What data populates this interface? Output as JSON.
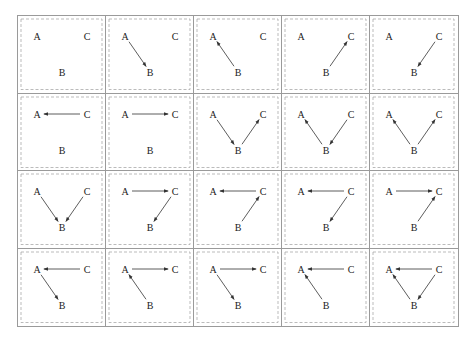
{
  "diagram": {
    "rows": 4,
    "cols": 5,
    "node_labels": {
      "A": "A",
      "B": "B",
      "C": "C"
    },
    "colors": {
      "cell_border": "#9a9a9a",
      "dashed_box": "#aaaaaa",
      "arrow": "#333333",
      "label": "#222222"
    },
    "cells": [
      {
        "edges": []
      },
      {
        "edges": [
          [
            "A",
            "B"
          ]
        ]
      },
      {
        "edges": [
          [
            "B",
            "A"
          ]
        ]
      },
      {
        "edges": [
          [
            "B",
            "C"
          ]
        ]
      },
      {
        "edges": [
          [
            "C",
            "B"
          ]
        ]
      },
      {
        "edges": [
          [
            "C",
            "A"
          ]
        ]
      },
      {
        "edges": [
          [
            "A",
            "C"
          ]
        ]
      },
      {
        "edges": [
          [
            "A",
            "B"
          ],
          [
            "B",
            "C"
          ]
        ]
      },
      {
        "edges": [
          [
            "B",
            "A"
          ],
          [
            "C",
            "B"
          ]
        ]
      },
      {
        "edges": [
          [
            "B",
            "A"
          ],
          [
            "B",
            "C"
          ]
        ]
      },
      {
        "edges": [
          [
            "A",
            "B"
          ],
          [
            "C",
            "B"
          ]
        ]
      },
      {
        "edges": [
          [
            "A",
            "C"
          ],
          [
            "C",
            "B"
          ]
        ]
      },
      {
        "edges": [
          [
            "C",
            "A"
          ],
          [
            "B",
            "C"
          ]
        ]
      },
      {
        "edges": [
          [
            "C",
            "A"
          ],
          [
            "C",
            "B"
          ]
        ]
      },
      {
        "edges": [
          [
            "A",
            "C"
          ],
          [
            "B",
            "C"
          ]
        ]
      },
      {
        "edges": [
          [
            "C",
            "A"
          ],
          [
            "A",
            "B"
          ]
        ]
      },
      {
        "edges": [
          [
            "A",
            "C"
          ],
          [
            "B",
            "A"
          ]
        ]
      },
      {
        "edges": [
          [
            "A",
            "C"
          ],
          [
            "A",
            "B"
          ]
        ]
      },
      {
        "edges": [
          [
            "C",
            "A"
          ],
          [
            "B",
            "A"
          ]
        ]
      },
      {
        "edges": [
          [
            "C",
            "A"
          ],
          [
            "B",
            "A"
          ],
          [
            "C",
            "B"
          ]
        ]
      }
    ]
  }
}
